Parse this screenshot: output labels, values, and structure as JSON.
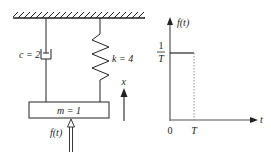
{
  "system": {
    "damper_label": "c = 2",
    "spring_label": "k = 4",
    "mass_label": "m = 1",
    "force_label": "f(t)",
    "displacement_label": "x"
  },
  "graph": {
    "y_axis_label": "f(t)",
    "x_axis_label": "t",
    "level_numerator": "1",
    "level_denominator": "T",
    "origin_label": "0",
    "pulse_end_label": "T"
  },
  "colors": {
    "stroke": "#222222",
    "arrow": "#555555",
    "dashed": "#888888"
  }
}
